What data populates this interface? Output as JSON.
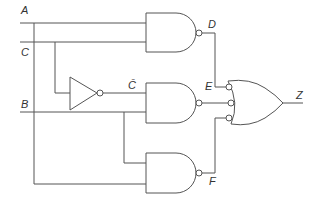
{
  "diagram": {
    "type": "logic-circuit",
    "inputs": [
      "A",
      "B",
      "C"
    ],
    "labels": {
      "A": "A",
      "B": "B",
      "C": "C",
      "C_bar": "C̄",
      "D": "D",
      "E": "E",
      "F": "F",
      "Z": "Z"
    },
    "gates": [
      {
        "id": "nand1",
        "type": "NAND",
        "inputs": [
          "A",
          "C"
        ],
        "output": "D"
      },
      {
        "id": "not1",
        "type": "NOT",
        "inputs": [
          "C"
        ],
        "output": "C̄"
      },
      {
        "id": "nand2",
        "type": "NAND",
        "inputs": [
          "C̄",
          "B"
        ],
        "output": "E"
      },
      {
        "id": "nand3",
        "type": "NAND",
        "inputs": [
          "B",
          "A"
        ],
        "output": "F"
      },
      {
        "id": "or1",
        "type": "OR with inverted inputs",
        "inputs": [
          "D",
          "E",
          "F"
        ],
        "output": "Z"
      }
    ],
    "colors": {
      "line": "#555555",
      "text": "#333333",
      "background": "#ffffff"
    }
  }
}
